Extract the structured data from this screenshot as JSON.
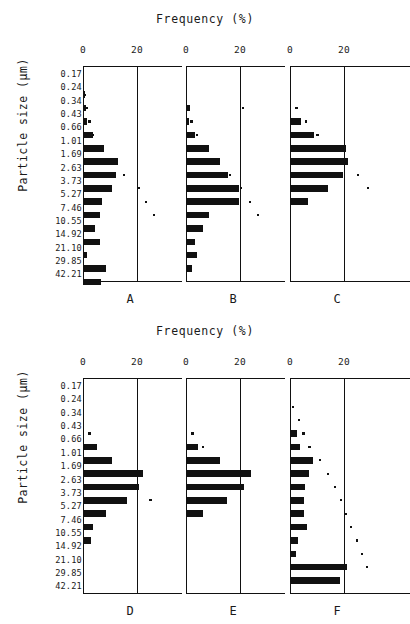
{
  "figure": {
    "axis_title": "Frequency (%)",
    "y_axis_label": "Particle size (μm)",
    "x_ticks": [
      "0",
      "20"
    ],
    "x_tick_values": [
      0,
      20
    ],
    "size_bins": [
      "0.17",
      "0.24",
      "0.34",
      "0.43",
      "0.66",
      "1.01",
      "1.69",
      "2.63",
      "3.73",
      "5.27",
      "7.46",
      "10.55",
      "14.92",
      "21.10",
      "29.85",
      "42.21"
    ],
    "panel_labels": [
      "A",
      "B",
      "C",
      "D",
      "E",
      "F"
    ]
  },
  "chart_data": {
    "type": "bar",
    "title": "Frequency (%)",
    "xlabel": "Frequency (%)",
    "ylabel": "Particle size (μm)",
    "xlim": [
      0,
      30
    ],
    "grid": true,
    "orientation": "horizontal",
    "categories": [
      "0.17",
      "0.24",
      "0.34",
      "0.43",
      "0.66",
      "1.01",
      "1.69",
      "2.63",
      "3.73",
      "5.27",
      "7.46",
      "10.55",
      "14.92",
      "21.10",
      "29.85",
      "42.21"
    ],
    "panels": [
      {
        "label": "A",
        "bars": [
          0.0,
          0.8,
          1.0,
          1.6,
          3.6,
          7.6,
          12.8,
          12.4,
          10.6,
          7.0,
          6.2,
          4.6,
          6.4,
          1.6,
          8.4,
          6.8
        ],
        "cumulative_dots": [
          0.0,
          0.4,
          1.0,
          2.0,
          3.2,
          6.6,
          10.0,
          14.8,
          20.2,
          22.8,
          26.0,
          0.0,
          0.0,
          0.0,
          0.0,
          0.0
        ]
      },
      {
        "label": "B",
        "bars": [
          0.0,
          0.0,
          1.4,
          1.0,
          3.2,
          8.6,
          12.6,
          15.4,
          19.6,
          19.6,
          8.6,
          6.4,
          3.2,
          4.0,
          2.2,
          0.0
        ],
        "cumulative_dots": [
          0.0,
          0.0,
          20.8,
          1.6,
          3.6,
          6.6,
          11.8,
          15.8,
          20.0,
          23.2,
          26.2,
          0.0,
          0.0,
          0.0,
          0.0,
          0.0
        ]
      },
      {
        "label": "C",
        "bars": [
          0.0,
          0.0,
          0.0,
          4.0,
          9.0,
          20.8,
          21.4,
          19.8,
          14.0,
          6.6,
          0.0,
          0.0,
          0.0,
          0.0,
          0.0,
          0.0
        ],
        "cumulative_dots": [
          0.0,
          0.0,
          2.0,
          5.6,
          9.8,
          14.0,
          20.0,
          24.8,
          28.4,
          0.0,
          0.0,
          0.0,
          0.0,
          0.0,
          0.0,
          0.0
        ]
      },
      {
        "label": "D",
        "bars": [
          0.0,
          0.0,
          0.4,
          0.0,
          5.2,
          10.8,
          22.4,
          20.6,
          16.2,
          8.6,
          3.8,
          3.0,
          0.0,
          0.0,
          0.0,
          0.0
        ],
        "cumulative_dots": [
          0.0,
          0.0,
          0.0,
          2.0,
          4.0,
          9.2,
          13.2,
          19.8,
          24.6,
          0.0,
          0.0,
          0.0,
          0.0,
          0.0,
          0.0,
          0.0
        ]
      },
      {
        "label": "E",
        "bars": [
          0.0,
          0.0,
          0.0,
          0.0,
          4.6,
          12.6,
          24.0,
          21.6,
          15.0,
          6.4,
          0.0,
          0.0,
          0.0,
          0.0,
          0.0,
          0.0
        ],
        "cumulative_dots": [
          0.0,
          0.0,
          0.0,
          2.0,
          5.8,
          9.4,
          14.0,
          19.2,
          0.0,
          0.0,
          0.0,
          0.0,
          0.0,
          0.0,
          0.0,
          0.0
        ]
      },
      {
        "label": "F",
        "bars": [
          0.0,
          0.0,
          0.0,
          2.6,
          3.6,
          8.4,
          7.0,
          5.4,
          5.2,
          5.0,
          6.4,
          2.8,
          2.4,
          21.2,
          18.6,
          0.0
        ],
        "cumulative_dots": [
          0.0,
          0.8,
          3.0,
          4.6,
          6.8,
          10.6,
          13.6,
          16.4,
          18.4,
          20.4,
          22.2,
          24.4,
          26.4,
          28.2,
          0.0,
          0.0
        ]
      }
    ]
  }
}
